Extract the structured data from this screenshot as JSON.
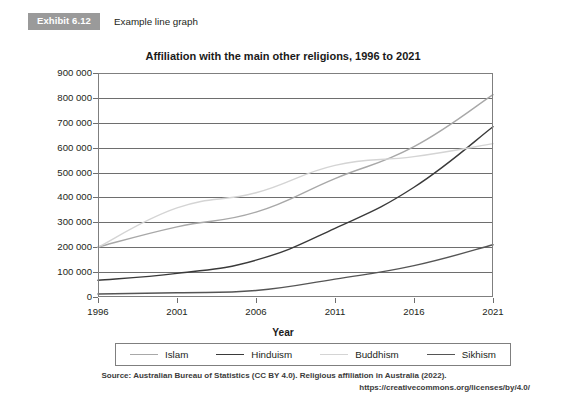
{
  "exhibit": {
    "badge": "Exhibit 6.12",
    "caption": "Example line graph"
  },
  "chart_data": {
    "type": "line",
    "title": "Affiliation with the main other religions, 1996 to 2021",
    "xlabel": "Year",
    "ylabel": "Person count",
    "categories": [
      "1996",
      "2001",
      "2006",
      "2011",
      "2016",
      "2021"
    ],
    "x": [
      1996,
      2001,
      2006,
      2011,
      2016,
      2021
    ],
    "xlim": [
      1996,
      2021
    ],
    "ylim": [
      0,
      900000
    ],
    "yticks": [
      "0",
      "100 000",
      "200 000",
      "300 000",
      "400 000",
      "500 000",
      "600 000",
      "700 000",
      "800 000",
      "900 000"
    ],
    "ytick_values": [
      0,
      100000,
      200000,
      300000,
      400000,
      500000,
      600000,
      700000,
      800000,
      900000
    ],
    "grid": true,
    "legend_position": "bottom",
    "series": [
      {
        "name": "Islam",
        "color": "#a8a8a8",
        "values": [
          201000,
          282000,
          341000,
          476000,
          604000,
          813000
        ]
      },
      {
        "name": "Hinduism",
        "color": "#3a3a3a",
        "values": [
          67000,
          95000,
          148000,
          276000,
          441000,
          684000
        ]
      },
      {
        "name": "Buddhism",
        "color": "#d4d4d4",
        "values": [
          200000,
          358000,
          419000,
          529000,
          564000,
          616000
        ]
      },
      {
        "name": "Sikhism",
        "color": "#555555",
        "values": [
          12000,
          17000,
          26000,
          72000,
          126000,
          210000
        ]
      }
    ]
  },
  "source": {
    "line1": "Source: Australian Bureau of Statistics (CC BY 4.0). Religious affiliation in Australia (2022).",
    "line2": "https://creativecommons.org/licenses/by/4.0/"
  },
  "colors": {
    "badge_background": "#9a9a9a",
    "axis": "#6e6e6e",
    "text": "#231f20"
  }
}
